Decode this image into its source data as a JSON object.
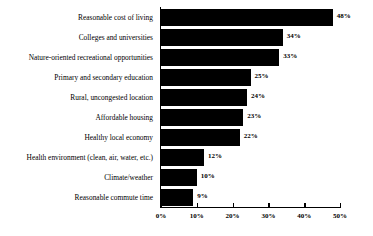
{
  "chart_data": {
    "type": "bar",
    "orientation": "horizontal",
    "title": "",
    "xlabel": "",
    "ylabel": "",
    "xlim": [
      0,
      50
    ],
    "grid": false,
    "legend": null,
    "value_suffix": "%",
    "categories": [
      "Reasonable cost of living",
      "Colleges and universities",
      "Nature-oriented recreational opportunities",
      "Primary and secondary education",
      "Rural, uncongested location",
      "Affordable housing",
      "Healthy local economy",
      "Health environment (clean, air, water, etc.)",
      "Climate/weather",
      "Reasonable commute time"
    ],
    "values": [
      48,
      34,
      33,
      25,
      24,
      23,
      22,
      12,
      10,
      9
    ],
    "data_labels": [
      "48%",
      "34%",
      "33%",
      "25%",
      "24%",
      "23%",
      "22%",
      "12%",
      "10%",
      "9%"
    ],
    "xticks": [
      0,
      10,
      20,
      30,
      40,
      50
    ],
    "xtick_labels": [
      "0%",
      "10%",
      "20%",
      "30%",
      "40%",
      "50%"
    ],
    "bar_color": "#000000",
    "background_color": "#ffffff",
    "axis_color": "#000000"
  }
}
